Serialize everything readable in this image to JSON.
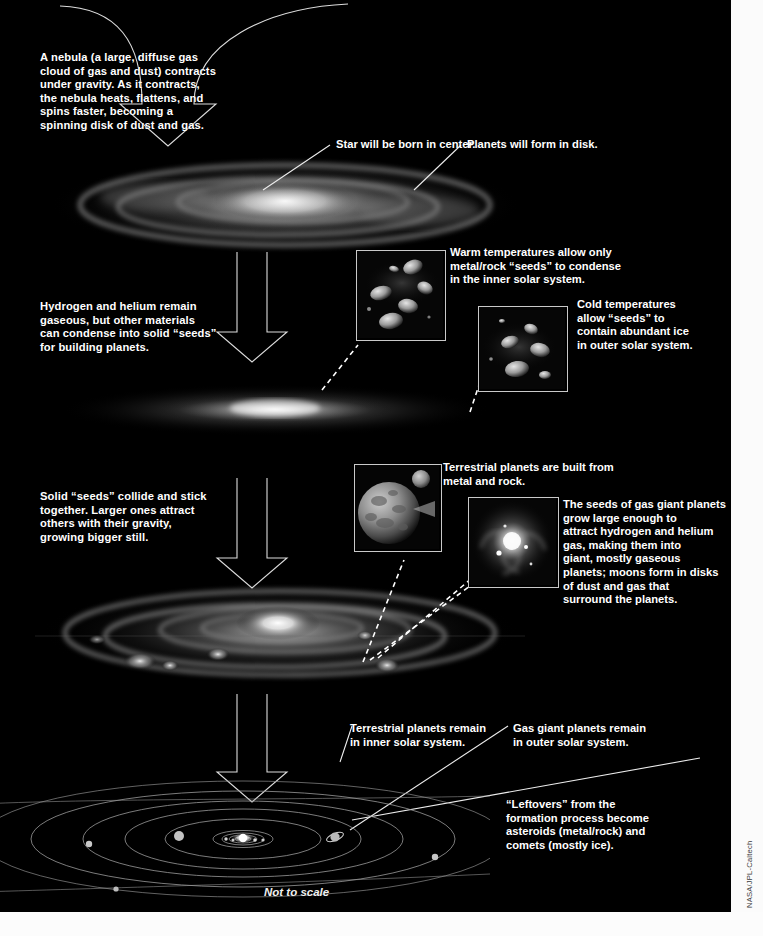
{
  "figure": {
    "credit": "NASA/JPL-Caltech",
    "scale_note": "Not to scale",
    "accent_color": "#ffffff",
    "background_color": "#000000",
    "panel_color": "#fbfbfb"
  },
  "steps": [
    {
      "id": "step-1-nebula",
      "text": "A nebula (a large, diffuse gas\ncloud of gas and dust) contracts\nunder gravity. As it contracts,\nthe nebula heats, flattens, and\nspins faster, becoming a\nspinning disk of dust and gas."
    },
    {
      "id": "step-2-condensation",
      "text": "Hydrogen and helium remain\ngaseous, but other materials\ncan condense into solid “seeds”\nfor building planets."
    },
    {
      "id": "step-3-accretion",
      "text": "Solid “seeds” collide and stick\ntogether. Larger ones attract\nothers with their gravity,\ngrowing bigger still."
    }
  ],
  "callouts": {
    "star_center": "Star will be born in center.",
    "planets_disk": "Planets will form in disk.",
    "warm_temps": "Warm temperatures allow only\nmetal/rock “seeds” to  condense\nin the inner solar system.",
    "cold_temps": "Cold temperatures\nallow “seeds” to\ncontain abundant ice\nin outer solar system.",
    "terrestrial_built": "Terrestrial planets are built from\nmetal and rock.",
    "gas_giant_seeds": "The seeds of gas giant planets\ngrow large enough to\nattract hydrogen and helium\ngas, making them into\ngiant, mostly gaseous\nplanets; moons form in disks\nof dust and gas that\nsurround the planets.",
    "terrestrial_remain": "Terrestrial planets remain\nin inner solar system.",
    "gas_giant_remain": "Gas giant planets remain\nin outer solar system.",
    "leftovers": "“Leftovers” from the\nformation process become\nasteroids (metal/rock) and\ncomets (mostly ice)."
  },
  "insets": [
    {
      "id": "inset-rocky-seeds",
      "name": "rocky-metal-seeds-image"
    },
    {
      "id": "inset-icy-seeds",
      "name": "icy-seeds-image"
    },
    {
      "id": "inset-terrestrial-planet",
      "name": "terrestrial-planet-image"
    },
    {
      "id": "inset-gas-giant-disk",
      "name": "gas-giant-subdisk-image"
    }
  ],
  "diagrams": [
    {
      "id": "disk-stage-1",
      "name": "contracting-nebula-disk"
    },
    {
      "id": "disk-stage-2",
      "name": "flattened-protoplanetary-disk"
    },
    {
      "id": "disk-stage-3",
      "name": "disk-with-planetesimals"
    },
    {
      "id": "solar-system",
      "name": "final-solar-system"
    }
  ]
}
